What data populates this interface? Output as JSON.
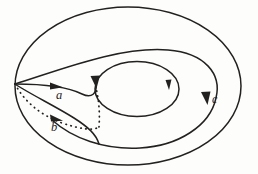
{
  "figure": {
    "kind": "torus-generator-diagram",
    "background_color": "#fdfdfc",
    "stroke_color": "#23211f",
    "width": 258,
    "height": 174,
    "labels": [
      {
        "id": "a",
        "text": "a",
        "x": 60,
        "y": 96,
        "style": "italic-serif",
        "curve": "loop-a"
      },
      {
        "id": "b",
        "text": "b",
        "x": 55,
        "y": 128,
        "style": "italic-serif",
        "curve": "loop-b"
      },
      {
        "id": "c",
        "text": "c",
        "x": 215,
        "y": 100,
        "style": "italic-serif",
        "curve": "loop-c"
      }
    ],
    "curves": [
      {
        "id": "outer-boundary",
        "role": "torus-outer-silhouette",
        "style": "solid",
        "stroke_width": 1.5,
        "closed": true,
        "center": [
          128,
          86
        ],
        "radius_x": 114,
        "radius_y": 80
      },
      {
        "id": "inner-hole",
        "role": "torus-hole",
        "style": "solid",
        "stroke_width": 1.5,
        "closed": true,
        "center": [
          137,
          89
        ],
        "radius_x": 42,
        "radius_y": 28
      },
      {
        "id": "loop-a",
        "role": "meridian-generator",
        "style": "solid",
        "stroke_width": 1.5,
        "oriented": true,
        "from_cusp": [
          15,
          84
        ],
        "arrowheads": [
          {
            "x": 58,
            "y": 86,
            "angle_deg": 18
          },
          {
            "x": 95,
            "y": 84,
            "angle_deg": 105
          }
        ]
      },
      {
        "id": "loop-b",
        "role": "meridian-generator-hidden-arc",
        "style": "dotted",
        "stroke_width": 1.6,
        "dash_pattern": "0.5 4.5",
        "oriented": true,
        "from_cusp": [
          15,
          84
        ],
        "arrowheads": [
          {
            "x": 58,
            "y": 119,
            "angle_deg": 22
          }
        ]
      },
      {
        "id": "loop-c",
        "role": "longitude-generator",
        "style": "solid",
        "stroke_width": 1.5,
        "oriented": true,
        "from_cusp": [
          15,
          84
        ],
        "arrowheads": [
          {
            "x": 205,
            "y": 100,
            "angle_deg": 100
          },
          {
            "x": 168,
            "y": 88,
            "angle_deg": 92
          }
        ]
      }
    ]
  }
}
